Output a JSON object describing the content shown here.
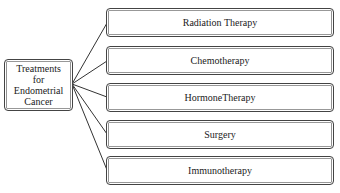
{
  "root": {
    "label_lines": [
      "Treatments",
      "for",
      "Endometrial",
      "Cancer"
    ]
  },
  "treatments": [
    {
      "label": "Radiation Therapy",
      "top": 8
    },
    {
      "label": "Chemotherapy",
      "top": 46
    },
    {
      "label": "HormoneTherapy",
      "top": 83
    },
    {
      "label": "Surgery",
      "top": 120
    },
    {
      "label": "Immunotherapy",
      "top": 156
    }
  ],
  "colors": {
    "border": "#444444",
    "line": "#333333",
    "background": "#ffffff"
  }
}
